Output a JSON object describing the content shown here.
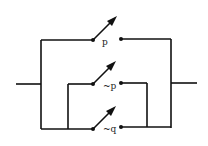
{
  "diagram": {
    "type": "switching-circuit",
    "switches": [
      {
        "label": "p",
        "y": 40
      },
      {
        "label": "~p",
        "y": 84
      },
      {
        "label": "~q",
        "y": 129
      }
    ],
    "colors": {
      "line": "#111111",
      "background": "#ffffff"
    }
  }
}
